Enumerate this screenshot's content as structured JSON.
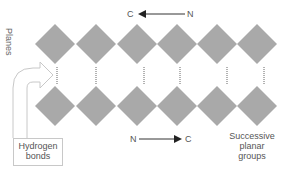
{
  "diagram": {
    "labels": {
      "planes": "Planes",
      "top_arrow_left": "C",
      "top_arrow_right": "N",
      "bottom_arrow_left": "N",
      "bottom_arrow_right": "C",
      "hydrogen_line1": "Hydrogen",
      "hydrogen_line2": "bonds",
      "successive_line1": "Successive",
      "successive_line2": "planar",
      "successive_line3": "groups"
    },
    "colors": {
      "diamond": "#a9a9a9",
      "dotted": "#666666",
      "text": "#555555",
      "outline": "#c8c8c8"
    },
    "top_row_centers_x": [
      55,
      96,
      137,
      177,
      217,
      257
    ],
    "top_row_center_y": 44,
    "bottom_row_center_y": 106,
    "diamond_half_size": 20
  }
}
